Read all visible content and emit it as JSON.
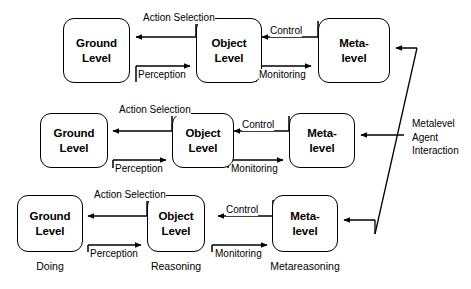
{
  "diagram": {
    "colors": {
      "stroke": "#000000",
      "text": "#000000",
      "background": "#ffffff"
    },
    "rows": [
      {
        "id": "row-top",
        "nodes": [
          {
            "id": "ground-level-top",
            "line1": "Ground",
            "line2": "Level"
          },
          {
            "id": "object-level-top",
            "line1": "Object",
            "line2": "Level"
          },
          {
            "id": "meta-level-top",
            "line1": "Meta-",
            "line2": "level"
          }
        ],
        "edges": [
          {
            "id": "action-selection-top",
            "line1": "Action",
            "line2": "Selection",
            "direction": "right-to-left"
          },
          {
            "id": "perception-top",
            "line1": "Perception",
            "line2": "",
            "direction": "left-to-right"
          },
          {
            "id": "control-top",
            "line1": "Control",
            "line2": "",
            "direction": "right-to-left"
          },
          {
            "id": "monitoring-top",
            "line1": "Monitoring",
            "line2": "",
            "direction": "left-to-right"
          }
        ]
      },
      {
        "id": "row-middle",
        "nodes": [
          {
            "id": "ground-level-middle",
            "line1": "Ground",
            "line2": "Level"
          },
          {
            "id": "object-level-middle",
            "line1": "Object",
            "line2": "Level"
          },
          {
            "id": "meta-level-middle",
            "line1": "Meta-",
            "line2": "level"
          }
        ],
        "edges": [
          {
            "id": "action-selection-middle",
            "line1": "Action",
            "line2": "Selection",
            "direction": "right-to-left"
          },
          {
            "id": "perception-middle",
            "line1": "Perception",
            "line2": "",
            "direction": "left-to-right"
          },
          {
            "id": "control-middle",
            "line1": "Control",
            "line2": "",
            "direction": "right-to-left"
          },
          {
            "id": "monitoring-middle",
            "line1": "Monitoring",
            "line2": "",
            "direction": "left-to-right"
          }
        ]
      },
      {
        "id": "row-bottom",
        "nodes": [
          {
            "id": "ground-level-bottom",
            "line1": "Ground",
            "line2": "Level"
          },
          {
            "id": "object-level-bottom",
            "line1": "Object",
            "line2": "Level"
          },
          {
            "id": "meta-level-bottom",
            "line1": "Meta-",
            "line2": "level"
          }
        ],
        "edges": [
          {
            "id": "action-selection-bottom",
            "line1": "Action",
            "line2": "Selection",
            "direction": "right-to-left"
          },
          {
            "id": "perception-bottom",
            "line1": "Perception",
            "line2": "",
            "direction": "left-to-right"
          },
          {
            "id": "control-bottom",
            "line1": "Control",
            "line2": "",
            "direction": "right-to-left"
          },
          {
            "id": "monitoring-bottom",
            "line1": "Monitoring",
            "line2": "",
            "direction": "left-to-right"
          }
        ],
        "captions": [
          {
            "id": "caption-doing",
            "text": "Doing"
          },
          {
            "id": "caption-reasoning",
            "text": "Reasoning"
          },
          {
            "id": "caption-metareasoning",
            "text": "Metareasoning"
          }
        ]
      }
    ],
    "side_annotation": {
      "id": "metalevel-agent-interaction",
      "line1": "Metalevel",
      "line2": "Agent",
      "line3": "Interaction"
    }
  }
}
